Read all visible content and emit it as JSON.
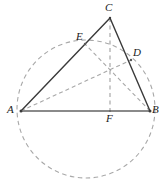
{
  "figure": {
    "type": "geometry-diagram",
    "width": 166,
    "height": 186,
    "background_color": "#ffffff",
    "colors": {
      "solid_stroke": "#3a3a3a",
      "base_stroke": "#8a8a8a",
      "dashed_stroke": "#a8a8a8",
      "label_color": "#1a1a1a"
    },
    "points": [
      {
        "id": "A",
        "label": "A",
        "x": 21,
        "y": 111,
        "label_x": 7,
        "label_y": 104
      },
      {
        "id": "B",
        "label": "B",
        "x": 150,
        "y": 111,
        "label_x": 152,
        "label_y": 104
      },
      {
        "id": "C",
        "label": "C",
        "x": 110,
        "y": 18,
        "label_x": 105,
        "label_y": 2
      },
      {
        "id": "D",
        "label": "D",
        "x": 131,
        "y": 60,
        "label_x": 133,
        "label_y": 47
      },
      {
        "id": "E",
        "label": "E",
        "x": 85,
        "y": 44,
        "label_x": 76,
        "label_y": 31
      },
      {
        "id": "F",
        "label": "F",
        "x": 110,
        "y": 111,
        "label_x": 106,
        "label_y": 113
      },
      {
        "id": "H",
        "label": "",
        "x": 110,
        "y": 70,
        "label_x": 0,
        "label_y": 0
      }
    ],
    "segments": [
      {
        "name": "segment-AC",
        "from": "A",
        "to": "C",
        "style": "solid",
        "stroke": "#3a3a3a",
        "width": 1.3
      },
      {
        "name": "segment-CB",
        "from": "C",
        "to": "B",
        "style": "solid",
        "stroke": "#3a3a3a",
        "width": 1.3
      },
      {
        "name": "segment-AB",
        "from": "A",
        "to": "B",
        "style": "solid",
        "stroke": "#8a8a8a",
        "width": 1.6
      },
      {
        "name": "cevian-CF",
        "from": "C",
        "to": "F",
        "style": "dashed",
        "stroke": "#a8a8a8",
        "width": 1.1
      },
      {
        "name": "cevian-AD",
        "from": "A",
        "to": "D",
        "style": "dashed",
        "stroke": "#a8a8a8",
        "width": 1.1
      },
      {
        "name": "cevian-BE",
        "from": "B",
        "to": "E",
        "style": "dashed",
        "stroke": "#a8a8a8",
        "width": 1.1
      }
    ],
    "circle": {
      "name": "circumscribed-circle",
      "cx": 86,
      "cy": 109,
      "r": 69,
      "style": "dashed",
      "stroke": "#a8a8a8",
      "width": 1.1
    }
  }
}
